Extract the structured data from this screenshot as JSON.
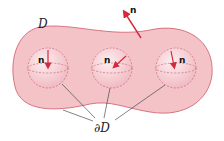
{
  "diagram": {
    "region_label": "D",
    "boundary_label": "∂D",
    "normal_label": "n",
    "colors": {
      "region_fill": "#f3c3c8",
      "region_stroke": "#d05a6a",
      "sphere_fill": "#f8dbe0",
      "arrow": "#d8283c",
      "leader": "#333333"
    },
    "spheres": [
      {
        "id": "left",
        "normal_label": "n"
      },
      {
        "id": "middle",
        "normal_label": "n"
      },
      {
        "id": "right",
        "normal_label": "n"
      }
    ]
  }
}
